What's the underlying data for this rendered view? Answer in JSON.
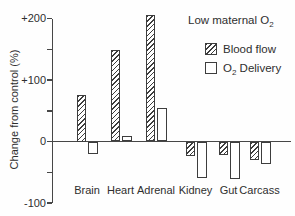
{
  "figure": {
    "ylabel": "Change from control (%)"
  },
  "legend": {
    "title": {
      "prefix": "Low maternal O",
      "sub": "2"
    },
    "items": [
      {
        "label_prefix": "Blood flow",
        "label_sub": "",
        "label_suffix": "",
        "swatch": "hatched"
      },
      {
        "label_prefix": "O",
        "label_sub": "2",
        "label_suffix": " Delivery",
        "swatch": "open"
      }
    ]
  },
  "chart_data": {
    "type": "bar",
    "categories": [
      "Brain",
      "Heart",
      "Adrenal",
      "Kidney",
      "Gut",
      "Carcass"
    ],
    "series": [
      {
        "name": "Blood flow",
        "style": "hatched",
        "values": [
          75,
          148,
          206,
          -22,
          -21,
          -29
        ]
      },
      {
        "name": "O₂ Delivery",
        "style": "open",
        "values": [
          -20,
          9,
          54,
          -59,
          -60,
          -36
        ]
      }
    ],
    "xlabel": "",
    "ylabel": "Change from control (%)",
    "ylim": [
      -100,
      210
    ],
    "yticks": [
      {
        "label": "+200",
        "value": 200
      },
      {
        "label": "+100",
        "value": 100
      },
      {
        "label": "0",
        "value": 0
      },
      {
        "label": "-100",
        "value": -100
      }
    ],
    "yticks_minor": [
      150,
      50,
      -50
    ],
    "grid": false,
    "legend_position": "upper right",
    "colors": {
      "outline": "#3d3d3d",
      "hatch_line": "#3d3d3d",
      "open_fill": "#ffffff",
      "background": "#fefefe"
    }
  }
}
